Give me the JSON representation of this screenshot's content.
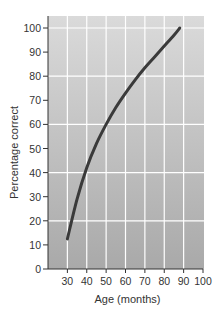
{
  "chart_data": {
    "type": "line",
    "title": "",
    "xlabel": "Age (months)",
    "ylabel": "Percentage correct",
    "xlim": [
      20,
      100
    ],
    "ylim": [
      0,
      105
    ],
    "xticks": [
      30,
      40,
      50,
      60,
      70,
      80,
      90,
      100
    ],
    "yticks": [
      0,
      10,
      20,
      30,
      40,
      50,
      60,
      70,
      80,
      90,
      100
    ],
    "grid": true,
    "legend": null,
    "series": [
      {
        "name": "Percentage correct",
        "color": "#3a3a3a",
        "x": [
          30,
          35,
          40,
          45,
          50,
          55,
          60,
          65,
          70,
          75,
          80,
          85,
          88
        ],
        "y": [
          12.5,
          29,
          42,
          52,
          60,
          67,
          73,
          78.5,
          83.5,
          88,
          92.5,
          97,
          100
        ]
      }
    ]
  },
  "colors": {
    "plot_bg_top": "#dadada",
    "plot_bg_bottom": "#a9a9a9",
    "grid": "#ffffff",
    "line": "#3a3a3a",
    "axis": "#333333"
  }
}
